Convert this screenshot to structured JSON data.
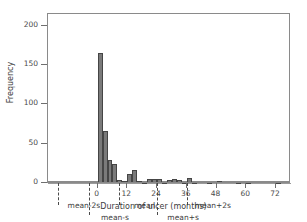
{
  "chart_data": {
    "type": "bar",
    "title": "",
    "xlabel": "Duration of ulcer (months)",
    "ylabel": "Frequency",
    "xlim": [
      -20,
      78
    ],
    "ylim": [
      0,
      210
    ],
    "xticks": [
      0,
      12,
      24,
      36,
      48,
      60,
      72
    ],
    "yticks": [
      0,
      50,
      100,
      150,
      200
    ],
    "grid": false,
    "legend": null,
    "bin_width": 2,
    "bin_starts": [
      0,
      2,
      4,
      6,
      8,
      10,
      12,
      14,
      16,
      18,
      20,
      22,
      24,
      26,
      28,
      30,
      32,
      34,
      36,
      38,
      40,
      42,
      44,
      46,
      48,
      50,
      52,
      54,
      56,
      58,
      60,
      62,
      64,
      66,
      68,
      70,
      72
    ],
    "values": [
      166,
      66,
      29,
      24,
      4,
      3,
      11,
      17,
      2,
      1,
      5,
      5,
      5,
      1,
      4,
      5,
      4,
      1,
      6,
      1,
      0,
      0,
      1,
      0,
      2,
      0,
      0,
      0,
      1,
      0,
      1,
      0,
      0,
      0,
      0,
      0,
      1
    ],
    "annotations": [
      {
        "label": "mean-2s",
        "x": -16,
        "row": 0
      },
      {
        "label": "mean-s",
        "x": -3.5,
        "row": 1
      },
      {
        "label": "mean",
        "x": 8.5,
        "row": 0
      },
      {
        "label": "mean+s",
        "x": 24,
        "row": 1
      },
      {
        "label": "mean+2s",
        "x": 36,
        "row": 0
      }
    ]
  },
  "axes": {
    "x_title": "Duration of ulcer (months)",
    "y_title": "Frequency",
    "x_tick_labels": [
      "0",
      "12",
      "24",
      "36",
      "48",
      "60",
      "72"
    ],
    "y_tick_labels": [
      "0",
      "50",
      "100",
      "150",
      "200"
    ]
  },
  "annotation_labels": [
    "mean-2s",
    "mean-s",
    "mean",
    "mean+s",
    "mean+2s"
  ],
  "colors": {
    "bar_fill": "#7a7a7a",
    "bar_edge": "#454545",
    "axis": "#8a8a8a",
    "text": "#3d3d3d",
    "background": "#ffffff"
  }
}
